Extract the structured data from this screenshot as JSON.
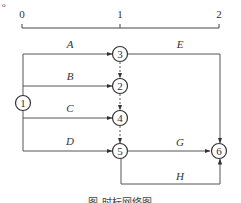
{
  "corner_mark": "o",
  "timescale": {
    "ticks": [
      {
        "label": "0",
        "x": 22
      },
      {
        "label": "1",
        "x": 120
      },
      {
        "label": "2",
        "x": 219
      }
    ]
  },
  "nodes": [
    {
      "id": "1",
      "label": "1",
      "x": 23,
      "y": 103
    },
    {
      "id": "2",
      "label": "2",
      "x": 120,
      "y": 86
    },
    {
      "id": "3",
      "label": "3",
      "x": 120,
      "y": 54
    },
    {
      "id": "4",
      "label": "4",
      "x": 120,
      "y": 118
    },
    {
      "id": "5",
      "label": "5",
      "x": 120,
      "y": 151
    },
    {
      "id": "6",
      "label": "6",
      "x": 218,
      "y": 151
    }
  ],
  "activities": [
    {
      "name": "A",
      "from": "1",
      "to": "3"
    },
    {
      "name": "B",
      "from": "1",
      "to": "2"
    },
    {
      "name": "C",
      "from": "1",
      "to": "4"
    },
    {
      "name": "D",
      "from": "1",
      "to": "5"
    },
    {
      "name": "E",
      "from": "3",
      "to": "6"
    },
    {
      "name": "G",
      "from": "5",
      "to": "6"
    },
    {
      "name": "H",
      "from": "5",
      "to": "6"
    }
  ],
  "dummy_activities": [
    {
      "from": "3",
      "to": "2"
    },
    {
      "from": "2",
      "to": "4"
    },
    {
      "from": "4",
      "to": "5"
    }
  ],
  "labels": {
    "A": "A",
    "B": "B",
    "C": "C",
    "D": "D",
    "E": "E",
    "G": "G",
    "H": "H",
    "n1": "1",
    "n2": "2",
    "n3": "3",
    "n4": "4",
    "n5": "5",
    "n6": "6"
  },
  "caption": "图 时标网络图"
}
